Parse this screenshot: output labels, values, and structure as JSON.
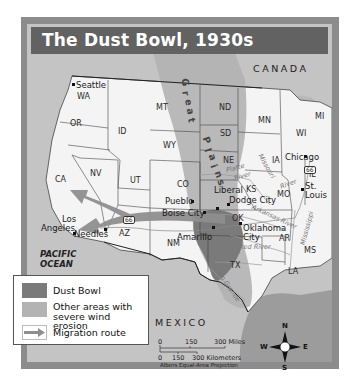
{
  "title": "The Dust Bowl, 1930s",
  "colors": {
    "frame": "#8c8c8c",
    "title_bar": "#626262",
    "land": "#f4f4f4",
    "neighbor_land": "#c4c4c4",
    "water": "#9c9c9c",
    "dust_bowl": "#7a7a7a",
    "wind_erosion": "#b3b3b3",
    "migration_route": "#8f8f8f"
  },
  "countries": [
    "CANADA",
    "MEXICO"
  ],
  "ocean": {
    "line1": "PACIFIC",
    "line2": "OCEAN"
  },
  "region_label": "Great Plains",
  "region_letters": [
    "G",
    "r",
    "e",
    "a",
    "t",
    "P",
    "l",
    "a",
    "i",
    "n",
    "s"
  ],
  "states": [
    "WA",
    "OR",
    "CA",
    "ID",
    "NV",
    "MT",
    "WY",
    "UT",
    "AZ",
    "CO",
    "NM",
    "ND",
    "SD",
    "NE",
    "KS",
    "OK",
    "TX",
    "MN",
    "IA",
    "MO",
    "AR",
    "LA",
    "WI",
    "IL",
    "MI",
    "MS"
  ],
  "cities": [
    "Seattle",
    "Chicago",
    "St. Louis",
    "Pueblo",
    "Liberal",
    "Dodge City",
    "Boise City",
    "Amarillo",
    "Oklahoma City",
    "Los Angeles",
    "Needles"
  ],
  "city_lines": {
    "st_louis": [
      "St.",
      "Louis"
    ],
    "oklahoma_city": [
      "Oklahoma",
      "City"
    ],
    "los_angeles": [
      "Los",
      "Angeles"
    ]
  },
  "rivers": [
    "Platte River",
    "Missouri River",
    "Arkansas River",
    "Red River",
    "Rio Grande",
    "Mississippi River"
  ],
  "river_parts": {
    "platte": [
      "Platte",
      "River"
    ],
    "missouri": "Missouri",
    "arkansas": "Arkansas River",
    "red": "Red River",
    "rio_grande": "Rio Grande",
    "mississippi": "Mississippi",
    "mo_river": "River"
  },
  "highway": "66",
  "legend": {
    "items": [
      {
        "label_lines": [
          "Dust Bowl"
        ],
        "swatch": "dust_bowl"
      },
      {
        "label_lines": [
          "Other areas with",
          "severe wind erosion"
        ],
        "swatch": "wind_erosion"
      },
      {
        "label_lines": [
          "Migration route"
        ],
        "swatch": "migration_route"
      }
    ]
  },
  "scale": {
    "miles_ticks": [
      "0",
      "150",
      "300 Miles"
    ],
    "km_ticks": [
      "0",
      "150",
      "300 Kilometers"
    ],
    "projection": "Albers Equal-Area Projection"
  },
  "compass": {
    "n": "N",
    "s": "S",
    "e": "E",
    "w": "W"
  }
}
